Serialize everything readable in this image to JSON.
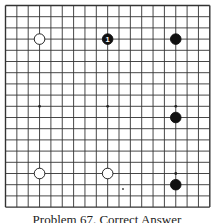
{
  "board": {
    "size": 19,
    "origin": [
      5.5,
      5.5
    ],
    "spacing": [
      11.35,
      11.2
    ],
    "line_color": "#333333",
    "hoshi": [
      [
        3,
        9
      ],
      [
        9,
        9
      ],
      [
        15,
        9
      ],
      [
        15,
        15
      ]
    ],
    "stones": [
      {
        "color": "white",
        "col": 3,
        "row": 3,
        "label": ""
      },
      {
        "color": "black",
        "col": 9,
        "row": 3,
        "label": "1"
      },
      {
        "color": "black",
        "col": 15,
        "row": 3,
        "label": ""
      },
      {
        "color": "black",
        "col": 15,
        "row": 10,
        "label": ""
      },
      {
        "color": "white",
        "col": 3,
        "row": 15,
        "label": ""
      },
      {
        "color": "white",
        "col": 9,
        "row": 15,
        "label": ""
      },
      {
        "color": "black",
        "col": 15,
        "row": 16,
        "label": ""
      }
    ],
    "marks": [
      {
        "type": "dot",
        "x": 123,
        "y": 189
      }
    ]
  },
  "caption": "Problem 67. Correct Answer"
}
